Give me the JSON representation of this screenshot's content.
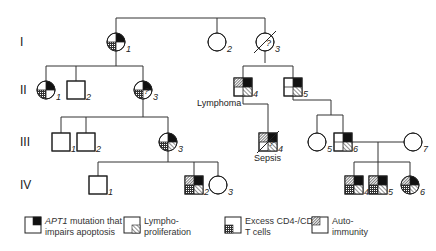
{
  "generations": [
    {
      "label": "I",
      "y": 42
    },
    {
      "label": "II",
      "y": 90
    },
    {
      "label": "III",
      "y": 142
    },
    {
      "label": "IV",
      "y": 185
    }
  ],
  "individuals": [
    {
      "id": "I-1",
      "num": "1",
      "sex": "female",
      "x": 116,
      "y": 42,
      "apt1": true,
      "lympho": false,
      "cd4cd8": true,
      "autoimmunity": false,
      "deceased": false
    },
    {
      "id": "I-2",
      "num": "2",
      "sex": "female",
      "x": 217,
      "y": 42,
      "apt1": false,
      "lympho": false,
      "cd4cd8": false,
      "autoimmunity": false,
      "deceased": false
    },
    {
      "id": "I-3",
      "num": "3",
      "sex": "female",
      "x": 265,
      "y": 42,
      "apt1": false,
      "lympho": false,
      "cd4cd8": false,
      "autoimmunity": false,
      "deceased": true,
      "question": "?"
    },
    {
      "id": "II-1",
      "num": "1",
      "sex": "female",
      "x": 46,
      "y": 90,
      "apt1": true,
      "lympho": false,
      "cd4cd8": true,
      "autoimmunity": false,
      "deceased": false
    },
    {
      "id": "II-2",
      "num": "2",
      "sex": "male",
      "x": 76,
      "y": 90,
      "apt1": false,
      "lympho": false,
      "cd4cd8": false,
      "autoimmunity": false,
      "deceased": false
    },
    {
      "id": "II-3",
      "num": "3",
      "sex": "female",
      "x": 143,
      "y": 90,
      "apt1": true,
      "lympho": false,
      "cd4cd8": true,
      "autoimmunity": false,
      "deceased": false,
      "question": "?"
    },
    {
      "id": "II-4",
      "num": "4",
      "sex": "male",
      "x": 243,
      "y": 87,
      "apt1": true,
      "lympho": true,
      "cd4cd8": false,
      "autoimmunity": true,
      "deceased": false,
      "note": "Lymphoma"
    },
    {
      "id": "II-5",
      "num": "5",
      "sex": "male",
      "x": 293,
      "y": 87,
      "apt1": true,
      "lympho": true,
      "cd4cd8": false,
      "autoimmunity": false,
      "deceased": false
    },
    {
      "id": "III-1",
      "num": "1",
      "sex": "male",
      "x": 61,
      "y": 142,
      "apt1": false,
      "lympho": false,
      "cd4cd8": false,
      "autoimmunity": false,
      "deceased": false
    },
    {
      "id": "III-2",
      "num": "2",
      "sex": "male",
      "x": 86,
      "y": 142,
      "apt1": false,
      "lympho": false,
      "cd4cd8": false,
      "autoimmunity": false,
      "deceased": false
    },
    {
      "id": "III-3",
      "num": "3",
      "sex": "female",
      "x": 168,
      "y": 142,
      "apt1": true,
      "lympho": true,
      "cd4cd8": true,
      "autoimmunity": false,
      "deceased": false
    },
    {
      "id": "III-4",
      "num": "4",
      "sex": "male",
      "x": 268,
      "y": 142,
      "apt1": true,
      "lympho": true,
      "cd4cd8": false,
      "autoimmunity": true,
      "deceased": true,
      "note": "Sepsis",
      "question": "?"
    },
    {
      "id": "III-5",
      "num": "5",
      "sex": "female",
      "x": 317,
      "y": 142,
      "apt1": false,
      "lympho": false,
      "cd4cd8": false,
      "autoimmunity": false,
      "deceased": false
    },
    {
      "id": "III-6",
      "num": "6",
      "sex": "male",
      "x": 343,
      "y": 142,
      "apt1": true,
      "lympho": true,
      "cd4cd8": false,
      "autoimmunity": false,
      "deceased": false
    },
    {
      "id": "III-7",
      "num": "7",
      "sex": "female",
      "x": 413,
      "y": 142,
      "apt1": false,
      "lympho": false,
      "cd4cd8": false,
      "autoimmunity": false,
      "deceased": false
    },
    {
      "id": "IV-1",
      "num": "1",
      "sex": "male",
      "x": 98,
      "y": 185,
      "apt1": false,
      "lympho": false,
      "cd4cd8": false,
      "autoimmunity": false,
      "deceased": false
    },
    {
      "id": "IV-2",
      "num": "2",
      "sex": "male",
      "x": 194,
      "y": 185,
      "apt1": true,
      "lympho": true,
      "cd4cd8": true,
      "autoimmunity": true,
      "deceased": false
    },
    {
      "id": "IV-3",
      "num": "3",
      "sex": "female",
      "x": 218,
      "y": 185,
      "apt1": false,
      "lympho": false,
      "cd4cd8": false,
      "autoimmunity": false,
      "deceased": false
    },
    {
      "id": "IV-4",
      "num": "4",
      "sex": "male",
      "x": 354,
      "y": 185,
      "apt1": true,
      "lympho": true,
      "cd4cd8": true,
      "autoimmunity": true,
      "deceased": false
    },
    {
      "id": "IV-5",
      "num": "5",
      "sex": "male",
      "x": 378,
      "y": 185,
      "apt1": true,
      "lympho": true,
      "cd4cd8": true,
      "autoimmunity": true,
      "deceased": false
    },
    {
      "id": "IV-6",
      "num": "6",
      "sex": "female",
      "x": 410,
      "y": 185,
      "apt1": true,
      "lympho": true,
      "cd4cd8": true,
      "autoimmunity": true,
      "deceased": false
    }
  ],
  "lines": [
    [
      116,
      18,
      265,
      18
    ],
    [
      116,
      18,
      116,
      33
    ],
    [
      217,
      18,
      217,
      33
    ],
    [
      265,
      18,
      265,
      33
    ],
    [
      116,
      51,
      116,
      66
    ],
    [
      46,
      66,
      143,
      66
    ],
    [
      46,
      66,
      46,
      81
    ],
    [
      76,
      66,
      76,
      81
    ],
    [
      143,
      66,
      143,
      81
    ],
    [
      265,
      51,
      265,
      63
    ],
    [
      243,
      66,
      293,
      66
    ],
    [
      243,
      66,
      243,
      78
    ],
    [
      293,
      66,
      293,
      78
    ],
    [
      143,
      99,
      143,
      117
    ],
    [
      61,
      117,
      168,
      117
    ],
    [
      61,
      117,
      61,
      133
    ],
    [
      86,
      117,
      86,
      133
    ],
    [
      168,
      117,
      168,
      133
    ],
    [
      243,
      96,
      243,
      104
    ],
    [
      243,
      104,
      268,
      104
    ],
    [
      268,
      104,
      268,
      133
    ],
    [
      293,
      96,
      293,
      100
    ],
    [
      293,
      100,
      331,
      100
    ],
    [
      331,
      100,
      331,
      115
    ],
    [
      317,
      115,
      343,
      115
    ],
    [
      317,
      115,
      317,
      133
    ],
    [
      343,
      115,
      343,
      133
    ],
    [
      352,
      142,
      404,
      142
    ],
    [
      378,
      142,
      378,
      162
    ],
    [
      354,
      162,
      410,
      162
    ],
    [
      354,
      162,
      354,
      176
    ],
    [
      378,
      162,
      378,
      176
    ],
    [
      410,
      162,
      410,
      176
    ],
    [
      168,
      151,
      168,
      162
    ],
    [
      98,
      162,
      218,
      162
    ],
    [
      98,
      162,
      98,
      176
    ],
    [
      194,
      162,
      194,
      176
    ],
    [
      218,
      162,
      218,
      176
    ]
  ],
  "legend": [
    {
      "key": "apt1",
      "text_line1_italic": "APT1",
      "text_line1": " mutation that",
      "text_line2": "impairs apoptosis"
    },
    {
      "key": "lympho",
      "text_line1": "Lympho-",
      "text_line2": "proliferation"
    },
    {
      "key": "cd4cd8",
      "text_line1": "Excess CD4-/CD8-",
      "text_line2": "T cells"
    },
    {
      "key": "autoimmunity",
      "text_line1": "Auto-",
      "text_line2": "immunity"
    }
  ],
  "colors": {
    "line": "#333333",
    "fill_solid": "#111111",
    "background": "#ffffff"
  }
}
